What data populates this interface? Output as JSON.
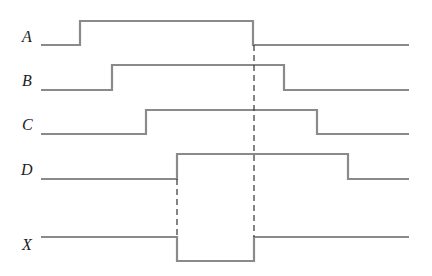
{
  "diagram": {
    "type": "timing-diagram",
    "colors": {
      "waveform": "#8a8a8a",
      "guide": "#333333",
      "label": "#222222",
      "background": "#ffffff"
    },
    "signals": [
      {
        "name": "A",
        "label_y": 42,
        "low_y": 45,
        "high_y": 21,
        "path": "M41,45 L80,45 L80,21 L253,21 L253,45 L409,45"
      },
      {
        "name": "B",
        "label_y": 86,
        "low_y": 90,
        "high_y": 65,
        "path": "M41,90 L112,90 L112,65 L284,65 L284,90 L409,90"
      },
      {
        "name": "C",
        "label_y": 130,
        "low_y": 134,
        "high_y": 110,
        "path": "M41,134 L146,134 L146,110 L317,110 L317,134 L409,134"
      },
      {
        "name": "D",
        "label_y": 175,
        "low_y": 179,
        "high_y": 154,
        "path": "M41,179 L177,179 L177,154 L348,154 L348,179 L409,179"
      },
      {
        "name": "X",
        "label_y": 250,
        "low_y": 261,
        "high_y": 237,
        "path": "M41,237 L177,237 L177,261 L254,261 L254,237 L409,237"
      }
    ],
    "guides": [
      {
        "from": "D rising edge",
        "to": "X falling edge",
        "x": 177,
        "y1": 179,
        "y2": 237
      },
      {
        "from": "A falling edge",
        "to": "X rising edge",
        "x": 254,
        "y1": 45,
        "y2": 237
      }
    ]
  }
}
